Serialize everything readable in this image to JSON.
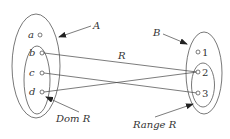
{
  "diagram": {
    "title": "",
    "colors": {
      "stroke": "#555555",
      "text": "#333333",
      "background": "#ffffff"
    },
    "sets": {
      "A": {
        "label": "A",
        "elements": [
          "a",
          "b",
          "c",
          "d"
        ]
      },
      "B": {
        "label": "B",
        "elements": [
          "1",
          "2",
          "3"
        ]
      },
      "domain": {
        "label": "Dom R",
        "elements": [
          "b",
          "c",
          "d"
        ]
      },
      "range": {
        "label": "Range R",
        "elements": [
          "2",
          "3"
        ]
      }
    },
    "relation": {
      "label": "R",
      "pairs": [
        {
          "from": "b",
          "to": "2"
        },
        {
          "from": "c",
          "to": "3"
        },
        {
          "from": "d",
          "to": "2"
        }
      ]
    },
    "left_points": [
      {
        "label": "a"
      },
      {
        "label": "b"
      },
      {
        "label": "c"
      },
      {
        "label": "d"
      }
    ],
    "right_points": [
      {
        "label": "1"
      },
      {
        "label": "2"
      },
      {
        "label": "3"
      }
    ]
  }
}
